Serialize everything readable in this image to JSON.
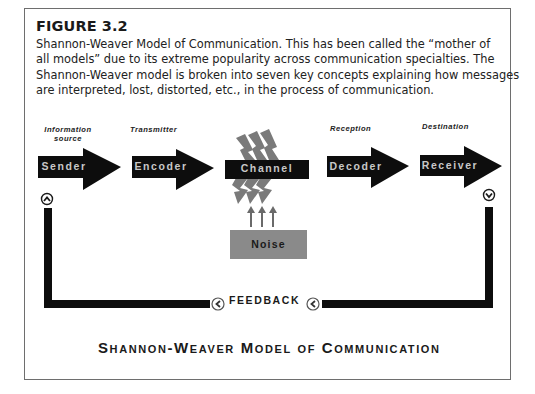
{
  "figure": {
    "label": "FIGURE 3.2",
    "caption_lines": [
      "Shannon-Weaver Model of Communication. This has been called the “mother of",
      "all models” due to its extreme popularity across communication specialties. The",
      "Shannon-Weaver model is broken into seven key concepts explaining how messages",
      "are interpreted, lost, distorted, etc., in the process of communication."
    ]
  },
  "diagram": {
    "roles": {
      "sender": [
        "Information",
        "source"
      ],
      "encoder": [
        "Transmitter"
      ],
      "decoder": [
        "Reception"
      ],
      "receiver": [
        "Destination"
      ]
    },
    "nodes": {
      "sender": "Sender",
      "encoder": "Encoder",
      "channel": "Channel",
      "decoder": "Decoder",
      "receiver": "Receiver",
      "noise": "Noise"
    },
    "feedback_label": "FEEDBACK",
    "title": "Shannon-Weaver Model of Communication",
    "colors": {
      "arrow_fill": "#0d0d0d",
      "arrow_text": "#c8c8c8",
      "noise_fill": "#8a8a8a",
      "lightning": "#7a7a7a",
      "frame_border": "#6e6e6e"
    }
  }
}
